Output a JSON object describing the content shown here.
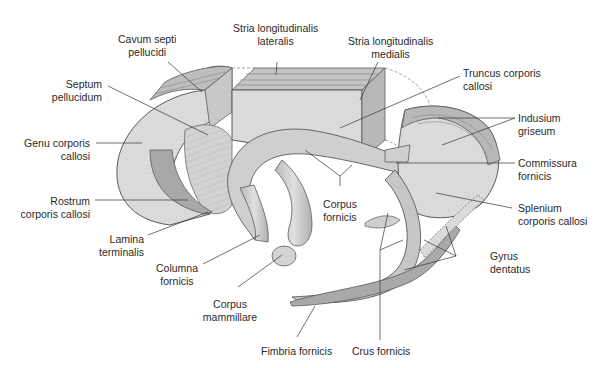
{
  "figure": {
    "colors": {
      "background": "#ffffff",
      "tissue_light": "#dcdcdc",
      "tissue_mid": "#c4c4c4",
      "tissue_dark": "#a8a8a8",
      "outline": "#5a5a5a",
      "leader_line": "#333333",
      "text": "#2a2a2a"
    },
    "labels": {
      "cavum_septi": {
        "line1": "Cavum septi",
        "line2": "pellucidi"
      },
      "stria_lat": {
        "line1": "Stria longitudinalis",
        "line2": "lateralis"
      },
      "stria_med": {
        "line1": "Stria longitudinalis",
        "line2": "medialis"
      },
      "truncus": {
        "line1": "Truncus corporis",
        "line2": "callosi"
      },
      "septum": {
        "line1": "Septum",
        "line2": "pellucidum"
      },
      "indusium": {
        "line1": "Indusium",
        "line2": "griseum"
      },
      "genu": {
        "line1": "Genu corporis",
        "line2": "callosi"
      },
      "commissura": {
        "line1": "Commissura",
        "line2": "fornicis"
      },
      "corpus_fornicis": {
        "line1": "Corpus",
        "line2": "fornicis"
      },
      "rostrum": {
        "line1": "Rostrum",
        "line2": "corporis callosi"
      },
      "splenium": {
        "line1": "Splenium",
        "line2": "corporis callosi"
      },
      "lamina": {
        "line1": "Lamina",
        "line2": "terminalis"
      },
      "gyrus_dentatus": {
        "line1": "Gyrus",
        "line2": "dentatus"
      },
      "columna": {
        "line1": "Columna",
        "line2": "fornicis"
      },
      "corpus_mammillare": {
        "line1": "Corpus",
        "line2": "mammillare"
      },
      "fimbria": {
        "line1": "Fimbria fornicis"
      },
      "crus": {
        "line1": "Crus fornicis"
      }
    }
  }
}
